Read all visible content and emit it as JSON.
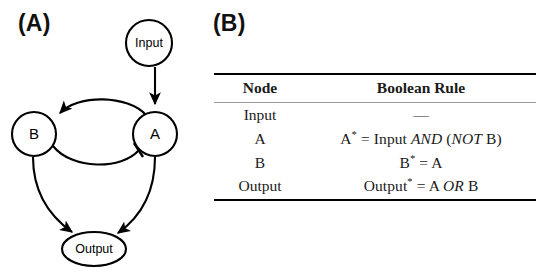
{
  "panels": {
    "a": {
      "label": "(A)"
    },
    "b": {
      "label": "(B)"
    }
  },
  "network": {
    "nodes": [
      {
        "id": "input",
        "label": "Input",
        "shape": "circle"
      },
      {
        "id": "a",
        "label": "A",
        "shape": "circle"
      },
      {
        "id": "b",
        "label": "B",
        "shape": "circle"
      },
      {
        "id": "output",
        "label": "Output",
        "shape": "ellipse"
      }
    ],
    "edges": [
      {
        "from": "input",
        "to": "a",
        "type": "activation"
      },
      {
        "from": "a",
        "to": "b",
        "type": "activation"
      },
      {
        "from": "b",
        "to": "a",
        "type": "inhibition"
      },
      {
        "from": "b",
        "to": "output",
        "type": "activation"
      },
      {
        "from": "a",
        "to": "output",
        "type": "activation"
      }
    ],
    "stroke_color": "#000000",
    "fill_color": "#ffffff"
  },
  "table": {
    "headers": {
      "node": "Node",
      "rule": "Boolean Rule"
    },
    "rows": [
      {
        "node": "Input",
        "rule_plain": "—"
      },
      {
        "node": "A",
        "rule_plain": "A* = Input AND (NOT B)"
      },
      {
        "node": "B",
        "rule_plain": "B* = A"
      },
      {
        "node": "Output",
        "rule_plain": "Output* = A OR B"
      }
    ],
    "rule_parts": {
      "input": {
        "dash": "—"
      },
      "a": {
        "lhs": "A",
        "star": "*",
        "eq": " = ",
        "t1": "Input ",
        "op1": "AND",
        "t2": " (",
        "op2": "NOT",
        "t3": " B)"
      },
      "b": {
        "lhs": "B",
        "star": "*",
        "eq": " = ",
        "t1": "A"
      },
      "output": {
        "lhs": "Output",
        "star": "*",
        "eq": " = ",
        "t1": "A ",
        "op1": "OR",
        "t2": " B"
      }
    },
    "rule_colors": {
      "top_rule": "#000000",
      "header_rule": "#9a9a9a",
      "bottom_rule": "#000000"
    }
  }
}
